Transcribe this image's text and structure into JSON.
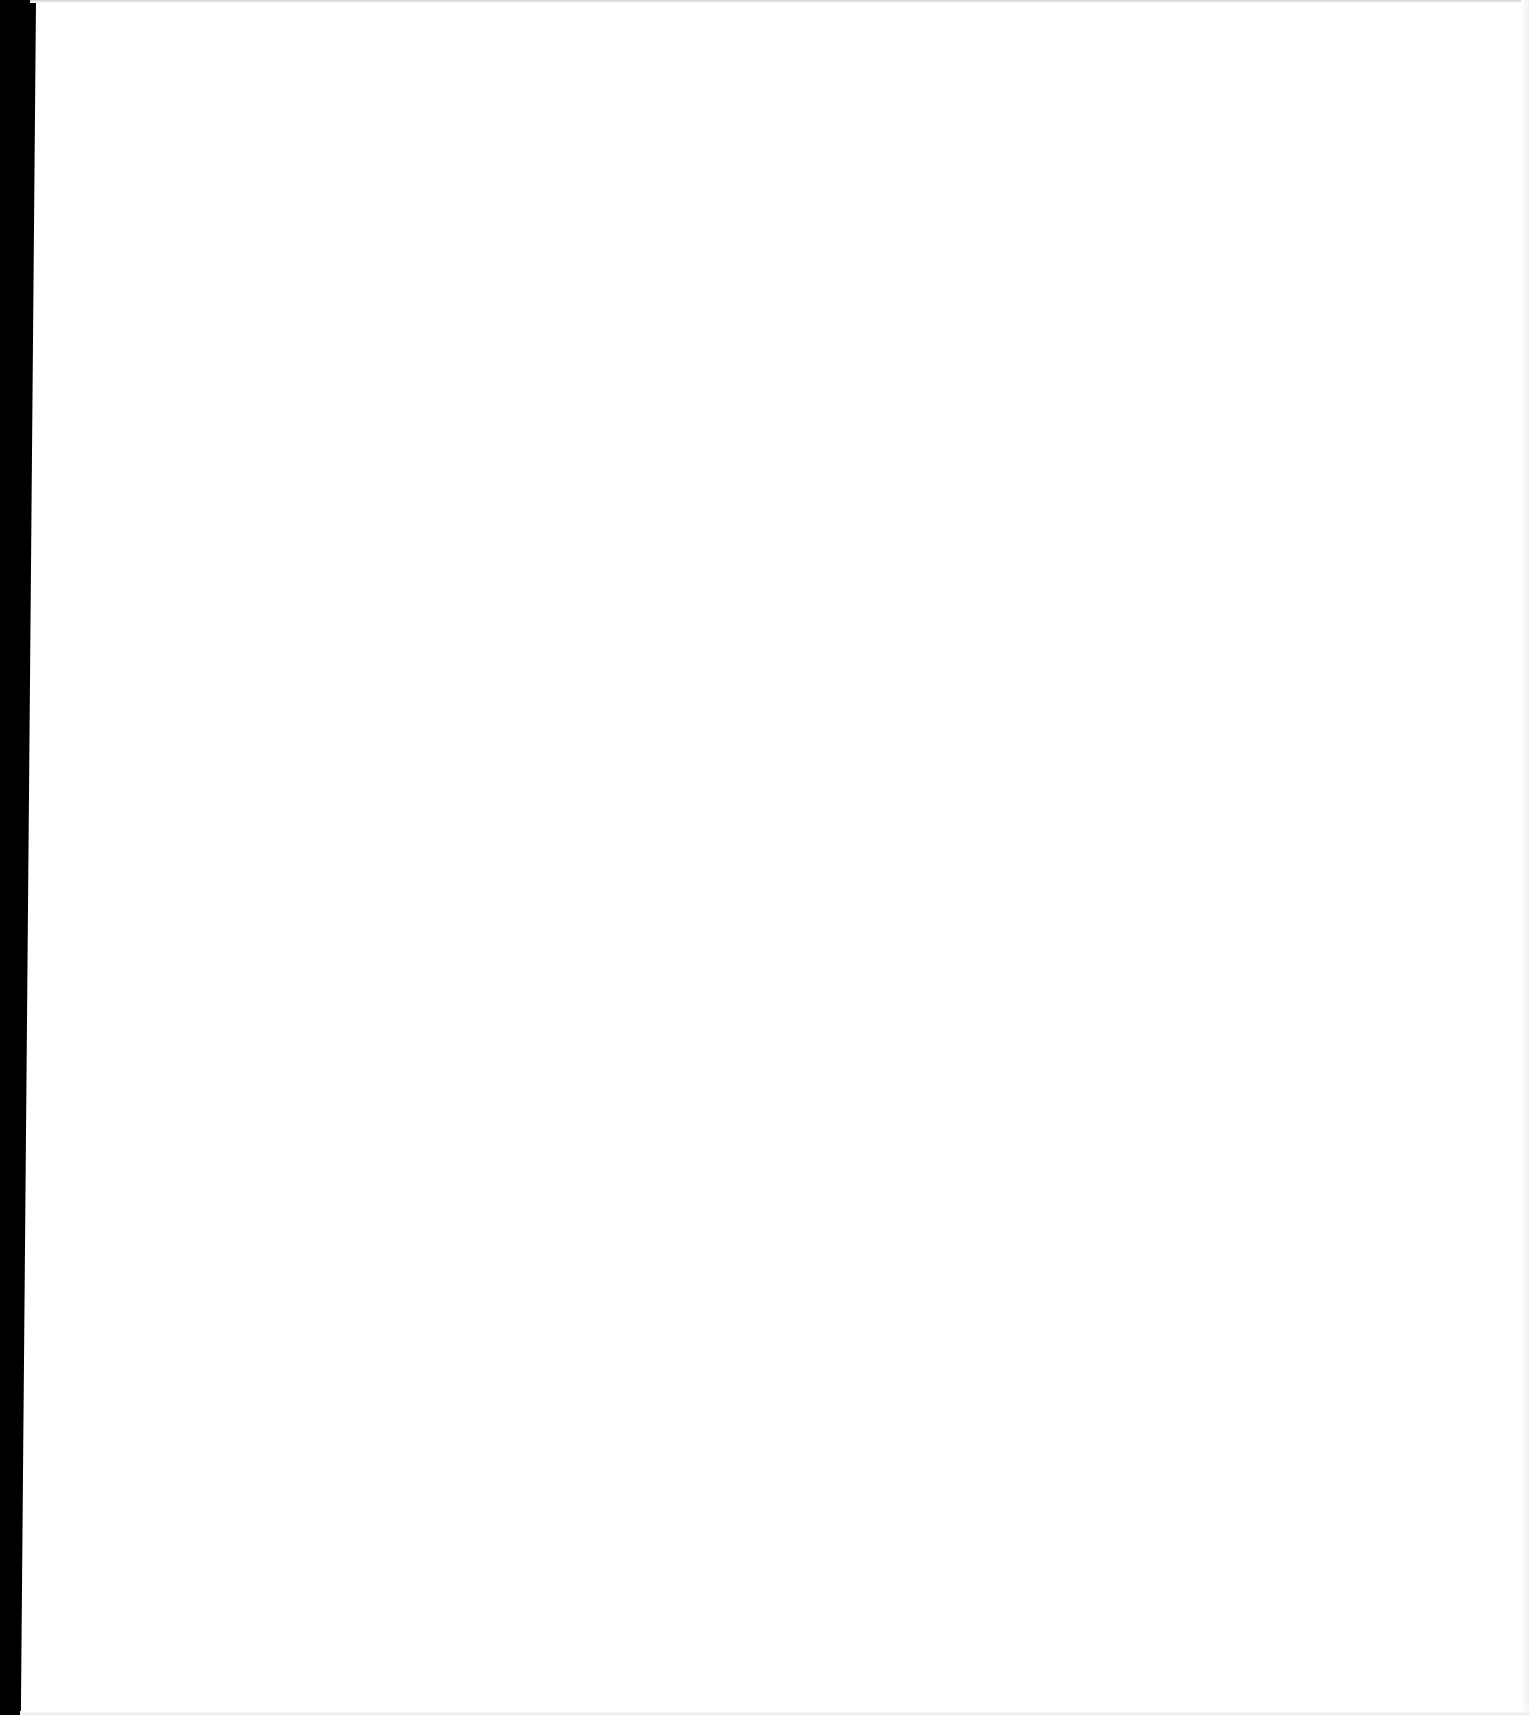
{
  "page": {
    "type": "blank-scanned-page",
    "background_color": "#ffffff",
    "edge_color": "#000000",
    "content": ""
  }
}
